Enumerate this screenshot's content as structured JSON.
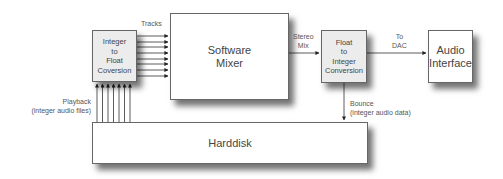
{
  "nodes": {
    "int_to_float": {
      "label": "Integer\nto\nFloat\nCoversion"
    },
    "mixer": {
      "label": "Software\nMixer"
    },
    "float_to_int": {
      "label": "Float\nto\nInteger\nConversion"
    },
    "audio_interface": {
      "label": "Audio\nInterface"
    },
    "harddisk": {
      "label": "Harddisk"
    }
  },
  "edges": {
    "tracks": "Tracks",
    "stereo_mix": "Stereo\nMix",
    "to_dac": "To\nDAC",
    "bounce": "Bounce\n(integer audio data)",
    "playback": "Playback\n(integer audio files)"
  },
  "colors": {
    "line": "#333333",
    "box_fill_gray": "#ececec"
  }
}
